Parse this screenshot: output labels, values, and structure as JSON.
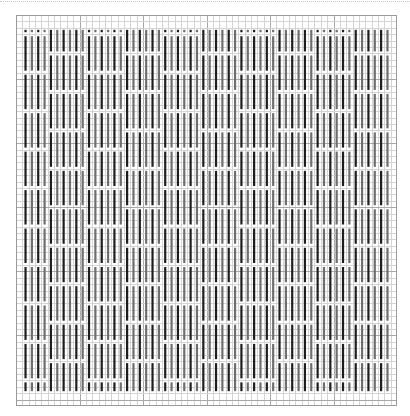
{
  "chart_data": {
    "type": "pattern-grid",
    "title": "",
    "columns": 60,
    "rows": 61,
    "major_every": 10,
    "colors": {
      "minor_grid": "#d4d4d4",
      "major_grid": "#a8a8a8",
      "border": "#9a9a9a",
      "bar_dark": "#1e1e1e",
      "bar_gray": "#6e6e6e",
      "background": "#ffffff"
    },
    "bar_region": {
      "first_col": 1,
      "last_col": 58,
      "first_row": 2,
      "last_row": 58
    },
    "column_groups": [
      {
        "start": 1,
        "width": 4,
        "phase": "A"
      },
      {
        "start": 5,
        "width": 6,
        "phase": "B"
      },
      {
        "start": 11,
        "width": 6,
        "phase": "A"
      },
      {
        "start": 17,
        "width": 6,
        "phase": "B"
      },
      {
        "start": 23,
        "width": 6,
        "phase": "A"
      },
      {
        "start": 29,
        "width": 6,
        "phase": "B"
      },
      {
        "start": 35,
        "width": 6,
        "phase": "A"
      },
      {
        "start": 41,
        "width": 6,
        "phase": "B"
      },
      {
        "start": 47,
        "width": 6,
        "phase": "A"
      },
      {
        "start": 53,
        "width": 6,
        "phase": "B"
      }
    ],
    "gap_period_rows": 6,
    "gap_offset": {
      "A": 3,
      "B": 6
    }
  }
}
